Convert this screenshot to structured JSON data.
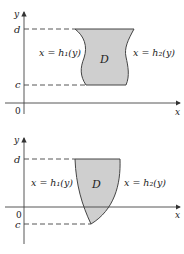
{
  "figures": [
    {
      "id": "top",
      "y_axis_label": "y",
      "x_axis_label": "x",
      "origin_label": "0",
      "upper_bound_label": "d",
      "lower_bound_label": "c",
      "left_curve_label": "x = h₁(y)",
      "right_curve_label": "x = h₂(y)",
      "region_label": "D",
      "region_fill": "#cfcfcf"
    },
    {
      "id": "bottom",
      "y_axis_label": "y",
      "x_axis_label": "x",
      "origin_label": "0",
      "upper_bound_label": "d",
      "lower_bound_label": "c",
      "left_curve_label": "x = h₁(y)",
      "right_curve_label": "x = h₂(y)",
      "region_label": "D",
      "region_fill": "#cfcfcf"
    }
  ]
}
